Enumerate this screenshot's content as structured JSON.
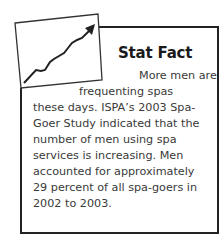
{
  "sidebar_box": {
    "icon": "rising-chart-icon",
    "title": "Stat Fact",
    "lines": [
      "More men are",
      "frequenting spas",
      "these days. ISPA’s 2003 Spa-",
      "Goer Study indicated that the",
      "number of men using spa",
      "services is increasing. Men",
      "accounted for approximately",
      "29 percent of all spa-goers in",
      "2002 to 2003."
    ]
  }
}
